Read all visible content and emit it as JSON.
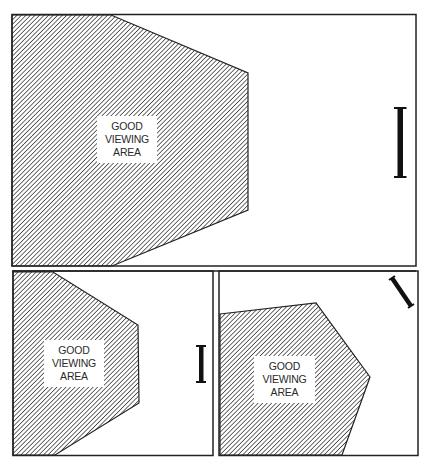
{
  "diagram": {
    "type": "viewing-area-illustration",
    "colors": {
      "line": "#222222",
      "hatch": "#3a3a3a",
      "background": "#ffffff"
    },
    "panels": [
      {
        "id": "top",
        "label_lines": [
          "GOOD",
          "VIEWING",
          "AREA"
        ],
        "screen": "vertical-large"
      },
      {
        "id": "bottom-left",
        "label_lines": [
          "GOOD",
          "VIEWING",
          "AREA"
        ],
        "screen": "vertical-small"
      },
      {
        "id": "bottom-right",
        "label_lines": [
          "GOOD",
          "VIEWING",
          "AREA"
        ],
        "screen": "angled"
      }
    ]
  }
}
